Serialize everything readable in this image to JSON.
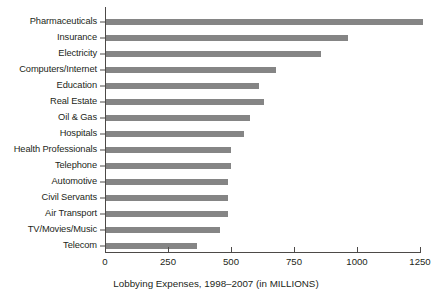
{
  "chart_data": {
    "type": "bar",
    "orientation": "horizontal",
    "title": "",
    "xlabel": "Lobbying Expenses, 1998–2007 (in MILLIONS)",
    "ylabel": "",
    "xlim": [
      0,
      1250
    ],
    "grid": false,
    "legend": null,
    "bar_color": "#858585",
    "axis_color": "#4d4a48",
    "xticks": [
      0,
      250,
      500,
      750,
      1000,
      1250
    ],
    "xtick_labels": [
      "0",
      "250",
      "500",
      "750",
      "1000",
      "1250"
    ],
    "categories": [
      "Pharmaceuticals",
      "Insurance",
      "Electricity",
      "Computers/Internet",
      "Education",
      "Real Estate",
      "Oil & Gas",
      "Hospitals",
      "Health Professionals",
      "Telephone",
      "Automotive",
      "Civil Servants",
      "Air Transport",
      "TV/Movies/Music",
      "Telecom"
    ],
    "values": [
      1258,
      960,
      855,
      675,
      607,
      627,
      572,
      548,
      496,
      496,
      484,
      484,
      484,
      452,
      361
    ]
  },
  "axis": {
    "caption": "Lobbying Expenses, 1998–2007 (in MILLIONS)"
  }
}
